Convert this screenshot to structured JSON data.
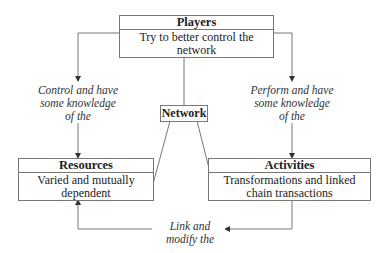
{
  "diagram": {
    "nodes": {
      "players": {
        "title": "Players",
        "description": "Try to better control the network"
      },
      "network": {
        "title": "Network"
      },
      "resources": {
        "title": "Resources",
        "description": "Varied and mutually dependent"
      },
      "activities": {
        "title": "Activities",
        "description": "Transformations and linked chain transactions"
      }
    },
    "edges": {
      "players_to_resources": {
        "line1": "Control and have",
        "line2": "some knowledge",
        "line3": "of the"
      },
      "players_to_activities": {
        "line1": "Perform and have",
        "line2": "some knowledge",
        "line3": "of the"
      },
      "activities_to_resources": {
        "line1": "Link and",
        "line2": "modify the"
      }
    },
    "line_color": "#777777"
  }
}
